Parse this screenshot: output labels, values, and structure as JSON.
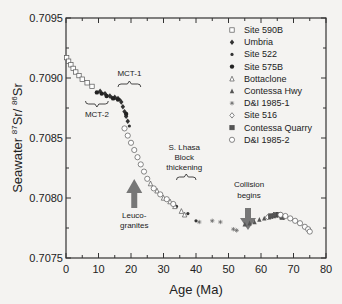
{
  "chart_data": {
    "type": "scatter",
    "title": "",
    "xlabel": "Age (Ma)",
    "ylabel": "Seawater 87Sr/86Sr",
    "ylabel_parts": {
      "prefix": "Seawater ",
      "sup1": "87",
      "mid": "Sr/ ",
      "sup2": "86",
      "suffix": "Sr"
    },
    "xlim": [
      0,
      80
    ],
    "ylim": [
      0.7075,
      0.7095
    ],
    "x_ticks": [
      0,
      10,
      20,
      30,
      40,
      50,
      60,
      70,
      80
    ],
    "x_tick_labels": [
      "0",
      "10",
      "20",
      "30",
      "40",
      "50",
      "60",
      "70",
      "80"
    ],
    "y_ticks": [
      0.7075,
      0.708,
      0.7085,
      0.709,
      0.7095
    ],
    "y_tick_labels": [
      "0.7075",
      "0.7080",
      "0.7085",
      "0.7090",
      "0.7095"
    ],
    "grid": false,
    "legend_position": "upper right",
    "legend": [
      "Site 590B",
      "Umbria",
      "Site 522",
      "Site 575B",
      "Bottaclone",
      "Contessa Hwy",
      "D&I 1985-1",
      "Site 516",
      "Contessa Quarry",
      "D&I 1985-2"
    ],
    "series": [
      {
        "name": "Site 590B",
        "marker": "square-open",
        "x": [
          0.2,
          0.8,
          1.5,
          2.2,
          3.0,
          4.0,
          5.0,
          6.5,
          8.0
        ],
        "y": [
          0.70917,
          0.70914,
          0.70911,
          0.70908,
          0.70905,
          0.70902,
          0.70899,
          0.70896,
          0.70893
        ]
      },
      {
        "name": "Umbria",
        "marker": "diamond-filled",
        "x": [
          10.5,
          12.0,
          13.5,
          15.0,
          16.0,
          17.0,
          17.5,
          18.0,
          18.5,
          19.0
        ],
        "y": [
          0.70889,
          0.70887,
          0.70885,
          0.70884,
          0.70883,
          0.7088,
          0.70876,
          0.70872,
          0.70868,
          0.70864
        ]
      },
      {
        "name": "Site 522",
        "marker": "dot",
        "x": [
          14.0,
          15.5,
          16.5,
          19.5,
          34.0,
          37.5,
          40.0
        ],
        "y": [
          0.70884,
          0.70883,
          0.70882,
          0.7086,
          0.70793,
          0.70787,
          0.70781
        ]
      },
      {
        "name": "Site 575B",
        "marker": "circle-filled",
        "x": [
          9.5,
          11.0,
          12.5,
          14.5,
          16.0,
          18.5
        ],
        "y": [
          0.70888,
          0.70887,
          0.70885,
          0.70883,
          0.70882,
          0.7087
        ]
      },
      {
        "name": "Bottaclone",
        "marker": "triangle-open",
        "x": [
          26.0,
          28.0,
          30.0,
          32.0,
          33.5,
          35.5,
          36.5
        ],
        "y": [
          0.70812,
          0.70806,
          0.708,
          0.70797,
          0.70793,
          0.70789,
          0.70786
        ]
      },
      {
        "name": "Contessa Hwy",
        "marker": "triangle-filled",
        "x": [
          55.0,
          56.5,
          58.0,
          59.5,
          61.0,
          62.5,
          64.0
        ],
        "y": [
          0.70778,
          0.70779,
          0.7078,
          0.70782,
          0.70783,
          0.70784,
          0.70785
        ]
      },
      {
        "name": "D&I 1985-1",
        "marker": "star",
        "x": [
          41.0,
          45.0,
          47.5,
          51.5,
          52.5
        ],
        "y": [
          0.7078,
          0.70781,
          0.7078,
          0.70774,
          0.70773
        ]
      },
      {
        "name": "Site 516",
        "marker": "diamond-open",
        "x": [
          62.0,
          63.5,
          65.0,
          66.0,
          67.0
        ],
        "y": [
          0.70784,
          0.70785,
          0.70786,
          0.70785,
          0.70784
        ]
      },
      {
        "name": "Contessa Quarry",
        "marker": "square-filled",
        "x": [
          63.0,
          64.5,
          65.5,
          66.5
        ],
        "y": [
          0.70785,
          0.70786,
          0.70786,
          0.70784
        ]
      },
      {
        "name": "D&I 1985-2",
        "marker": "circle-open",
        "x": [
          18.0,
          19.0,
          20.0,
          21.0,
          22.0,
          23.0,
          24.0,
          25.0,
          27.0,
          29.0,
          31.0,
          33.0,
          66.0,
          67.5,
          69.0,
          70.5,
          72.0,
          73.5,
          74.5,
          75.0
        ],
        "y": [
          0.70858,
          0.70852,
          0.70846,
          0.7084,
          0.70834,
          0.70828,
          0.70822,
          0.70816,
          0.70808,
          0.70803,
          0.70799,
          0.70795,
          0.70786,
          0.70785,
          0.70783,
          0.70781,
          0.70779,
          0.70776,
          0.70774,
          0.70772
        ]
      }
    ],
    "annotations": [
      {
        "id": "mct1",
        "text": "MCT-1",
        "type": "brace",
        "x_range": [
          16,
          23
        ],
        "y": 0.70895
      },
      {
        "id": "mct2",
        "text": "MCT-2",
        "type": "brace",
        "x_range": [
          6,
          13
        ],
        "y": 0.70868
      },
      {
        "id": "leuco",
        "text_lines": [
          "Leuco-",
          "granites"
        ],
        "type": "arrow-up",
        "x": 21,
        "y_tip": 0.70822
      },
      {
        "id": "lhasa",
        "text_lines": [
          "S. Lhasa",
          "Block",
          "thickening"
        ],
        "type": "brace",
        "x_range": [
          34,
          40
        ],
        "y": 0.70807
      },
      {
        "id": "collision",
        "text_lines": [
          "Collision",
          "begins"
        ],
        "type": "arrow-down",
        "x": 56,
        "y_tip": 0.70782
      }
    ]
  }
}
